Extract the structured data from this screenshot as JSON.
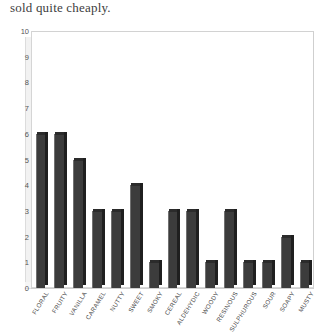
{
  "caption": "sold quite cheaply.",
  "colors": {
    "bar_face": "#3c3c3c",
    "bar_side": "#1f1f1f",
    "bar_top": "#2b2b2b",
    "frame": "#d8d8d8",
    "wall": "#f2f2f2",
    "text": "#4a4a4a",
    "caption_text": "#3d3d3d"
  },
  "chart_data": {
    "type": "bar",
    "title": "",
    "xlabel": "",
    "ylabel": "",
    "ylim": [
      0,
      10
    ],
    "yticks": [
      0,
      1,
      2,
      3,
      4,
      5,
      6,
      7,
      8,
      9,
      10
    ],
    "ytick_labels": [
      "0",
      "1",
      "2",
      "3",
      "4",
      "5",
      "6",
      "7",
      "8",
      "9",
      "10"
    ],
    "grid": false,
    "legend": null,
    "style": "3d-bar",
    "categories": [
      "FLORAL",
      "FRUITY",
      "VANILLA",
      "CARAMEL",
      "NUTTY",
      "SWEET",
      "SMOKY",
      "CEREAL",
      "ALDEHYDIC",
      "WOODY",
      "RESINOUS",
      "SULPHUROUS",
      "SOUR",
      "SOAPY",
      "MUSTY"
    ],
    "values": [
      6,
      6,
      5,
      3,
      3,
      4,
      1,
      3,
      3,
      1,
      3,
      1,
      1,
      2,
      1
    ]
  }
}
